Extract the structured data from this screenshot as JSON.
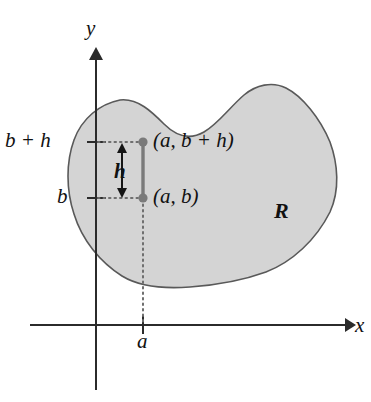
{
  "figure": {
    "type": "math-diagram",
    "axes": {
      "x_label": "x",
      "y_label": "y",
      "x_tick_label": "a",
      "y_tick_labels": [
        "b",
        "b + h"
      ]
    },
    "points": [
      {
        "name": "lower-point",
        "label": "(a, b)"
      },
      {
        "name": "upper-point",
        "label": "(a, b + h)"
      }
    ],
    "measures": [
      {
        "name": "segment-length",
        "label": "h"
      }
    ],
    "region": {
      "label": "R",
      "fill_color": "#d4d4d4",
      "stroke_color": "#595959"
    },
    "colors": {
      "axis": "#2b2b2b",
      "segment": "#7a7a7a",
      "point": "#7a7a7a",
      "dotted_guide": "#6e6e6e",
      "text": "#111111"
    }
  }
}
